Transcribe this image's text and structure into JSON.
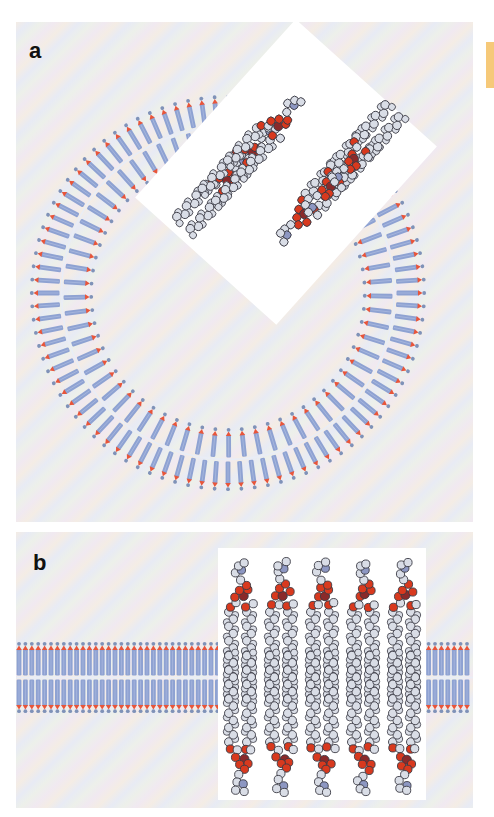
{
  "figure": {
    "panels": [
      {
        "id": "a",
        "label": "a",
        "description": "Lipid bilayer vesicle (liposome) cross-section with space-filling molecular inset",
        "vesicle": {
          "cx": 212,
          "cy": 271,
          "r_outer": 195,
          "r_inner": 138,
          "lipid_count": 92
        },
        "inset": {
          "shape": "rotated-square",
          "rotation_deg": -48,
          "molecules": 6
        }
      },
      {
        "id": "b",
        "label": "b",
        "description": "Planar lipid bilayer with space-filling molecular inset",
        "bilayer": {
          "y_top": 113,
          "y_bottom": 178,
          "lipid_spacing": 6.4
        },
        "inset": {
          "shape": "square",
          "x": 202,
          "y": 16,
          "w": 208,
          "h": 252,
          "molecules_per_leaflet": 5
        }
      }
    ],
    "colors": {
      "lipid_tail": "#8ea2d2",
      "lipid_head": "#e8553a",
      "lipid_cap": "#7f92b8",
      "atom_carbon": "#d9dde6",
      "atom_outline": "#3a3a44",
      "atom_oxygen": "#d8391e",
      "atom_phosphorus": "#8a2a2a",
      "atom_nitrogen": "#8d97c2",
      "inset_bg": "#ffffff",
      "side_tab": "#f6c979"
    }
  }
}
